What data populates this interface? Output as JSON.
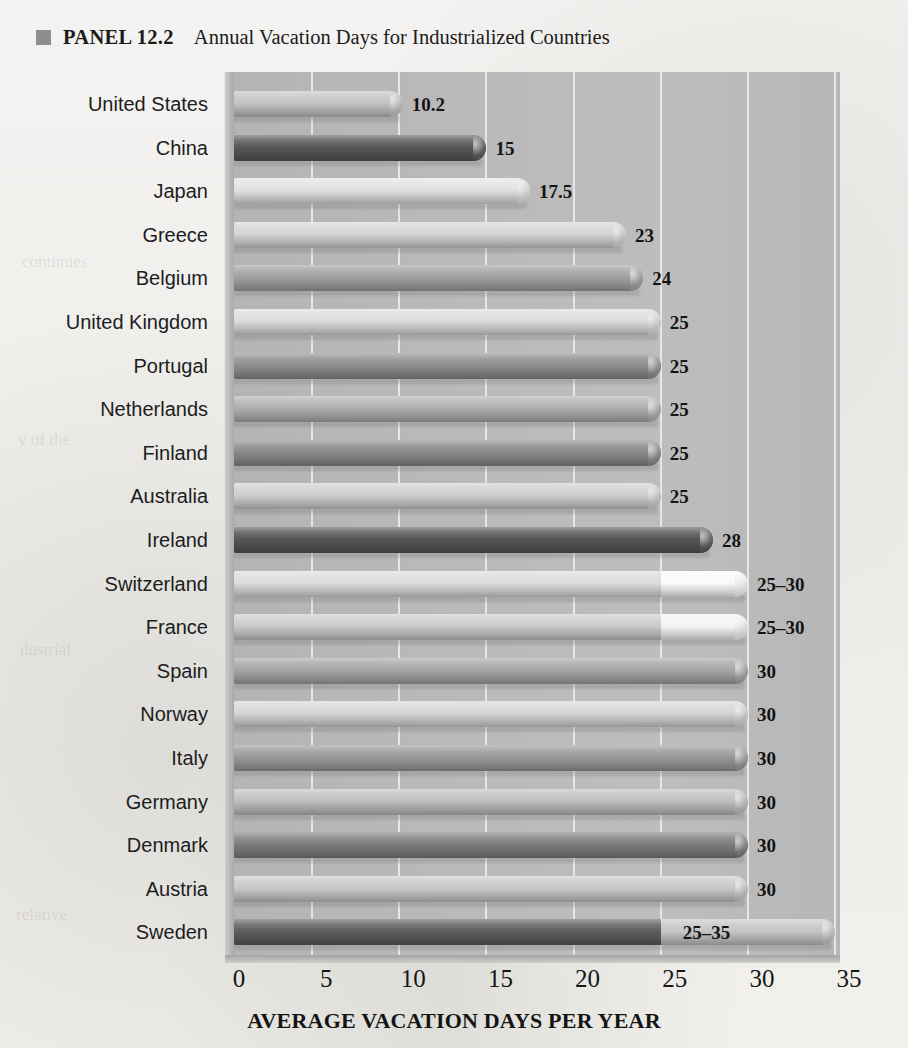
{
  "header": {
    "marker_icon": "square-marker-icon",
    "panel_label": "PANEL 12.2",
    "title": "Annual Vacation Days for Industrialized Countries"
  },
  "colors": {
    "plot_background": "#b9b9b9",
    "gridline": "#eeeeee",
    "page_background": "#f2f1ef",
    "title_marker": "#8d8d8d",
    "text": "#1b1b1b"
  },
  "chart_data": {
    "type": "bar",
    "orientation": "horizontal",
    "title": "Annual Vacation Days for Industrialized Countries",
    "xlabel": "AVERAGE VACATION DAYS PER YEAR",
    "ylabel": "",
    "xlim": [
      0,
      35
    ],
    "xticks": [
      0,
      5,
      10,
      15,
      20,
      25,
      30,
      35
    ],
    "xtick_labels": [
      "0",
      "5",
      "10",
      "15",
      "20",
      "25",
      "30",
      "35"
    ],
    "grid": true,
    "grid_axis": "x",
    "legend": false,
    "categories": [
      "United States",
      "China",
      "Japan",
      "Greece",
      "Belgium",
      "United Kingdom",
      "Portugal",
      "Netherlands",
      "Finland",
      "Australia",
      "Ireland",
      "Switzerland",
      "France",
      "Spain",
      "Norway",
      "Italy",
      "Germany",
      "Denmark",
      "Austria",
      "Sweden"
    ],
    "values": [
      10.2,
      15,
      17.5,
      23,
      24,
      25,
      25,
      25,
      25,
      25,
      28,
      30,
      30,
      30,
      30,
      30,
      30,
      30,
      30,
      35
    ],
    "data_labels": [
      "10.2",
      "15",
      "17.5",
      "23",
      "24",
      "25",
      "25",
      "25",
      "25",
      "25",
      "28",
      "25–30",
      "25–30",
      "30",
      "30",
      "30",
      "30",
      "30",
      "30",
      "25–35"
    ],
    "bars": [
      {
        "country": "United States",
        "label": "10.2",
        "value": 10.2,
        "range": null,
        "fill": "#c4c4c4",
        "segment_split": null,
        "segment_fill": null,
        "label_inside": false
      },
      {
        "country": "China",
        "label": "15",
        "value": 15,
        "range": null,
        "fill": "#585858",
        "segment_split": null,
        "segment_fill": null,
        "label_inside": false
      },
      {
        "country": "Japan",
        "label": "17.5",
        "value": 17.5,
        "range": null,
        "fill": "#e2e2e2",
        "segment_split": null,
        "segment_fill": null,
        "label_inside": false
      },
      {
        "country": "Greece",
        "label": "23",
        "value": 23,
        "range": null,
        "fill": "#d4d4d4",
        "segment_split": null,
        "segment_fill": null,
        "label_inside": false
      },
      {
        "country": "Belgium",
        "label": "24",
        "value": 24,
        "range": null,
        "fill": "#a2a2a2",
        "segment_split": null,
        "segment_fill": null,
        "label_inside": false
      },
      {
        "country": "United Kingdom",
        "label": "25",
        "value": 25,
        "range": null,
        "fill": "#dcdcdc",
        "segment_split": null,
        "segment_fill": null,
        "label_inside": false
      },
      {
        "country": "Portugal",
        "label": "25",
        "value": 25,
        "range": null,
        "fill": "#8e8e8e",
        "segment_split": null,
        "segment_fill": null,
        "label_inside": false
      },
      {
        "country": "Netherlands",
        "label": "25",
        "value": 25,
        "range": null,
        "fill": "#b0b0b0",
        "segment_split": null,
        "segment_fill": null,
        "label_inside": false
      },
      {
        "country": "Finland",
        "label": "25",
        "value": 25,
        "range": null,
        "fill": "#8a8a8a",
        "segment_split": null,
        "segment_fill": null,
        "label_inside": false
      },
      {
        "country": "Australia",
        "label": "25",
        "value": 25,
        "range": null,
        "fill": "#cfcfcf",
        "segment_split": null,
        "segment_fill": null,
        "label_inside": false
      },
      {
        "country": "Ireland",
        "label": "28",
        "value": 28,
        "range": null,
        "fill": "#565656",
        "segment_split": null,
        "segment_fill": null,
        "label_inside": false
      },
      {
        "country": "Switzerland",
        "label": "25–30",
        "value": 30,
        "range": [
          25,
          30
        ],
        "fill": "#dcdcdc",
        "segment_split": 25,
        "segment_fill": "#fafafa",
        "label_inside": false
      },
      {
        "country": "France",
        "label": "25–30",
        "value": 30,
        "range": [
          25,
          30
        ],
        "fill": "#cbcbcb",
        "segment_split": 25,
        "segment_fill": "#f4f4f4",
        "label_inside": false
      },
      {
        "country": "Spain",
        "label": "30",
        "value": 30,
        "range": null,
        "fill": "#a6a6a6",
        "segment_split": null,
        "segment_fill": null,
        "label_inside": false
      },
      {
        "country": "Norway",
        "label": "30",
        "value": 30,
        "range": null,
        "fill": "#d6d6d6",
        "segment_split": null,
        "segment_fill": null,
        "label_inside": false
      },
      {
        "country": "Italy",
        "label": "30",
        "value": 30,
        "range": null,
        "fill": "#9a9a9a",
        "segment_split": null,
        "segment_fill": null,
        "label_inside": false
      },
      {
        "country": "Germany",
        "label": "30",
        "value": 30,
        "range": null,
        "fill": "#bfbfbf",
        "segment_split": null,
        "segment_fill": null,
        "label_inside": false
      },
      {
        "country": "Denmark",
        "label": "30",
        "value": 30,
        "range": null,
        "fill": "#7e7e7e",
        "segment_split": null,
        "segment_fill": null,
        "label_inside": false
      },
      {
        "country": "Austria",
        "label": "30",
        "value": 30,
        "range": null,
        "fill": "#c9c9c9",
        "segment_split": null,
        "segment_fill": null,
        "label_inside": false
      },
      {
        "country": "Sweden",
        "label": "25–35",
        "value": 35,
        "range": [
          25,
          35
        ],
        "fill": "#5e5e5e",
        "segment_split": 25,
        "segment_fill": "#c6c6c6",
        "label_inside": true
      }
    ]
  }
}
